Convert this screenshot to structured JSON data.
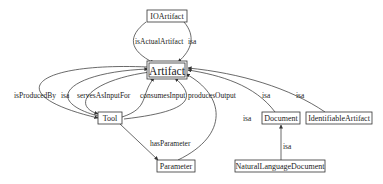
{
  "diagram": {
    "nodes": {
      "ioartifact": {
        "label": "IOArtifact"
      },
      "artifact": {
        "label": "Artifact"
      },
      "tool": {
        "label": "Tool"
      },
      "parameter": {
        "label": "Parameter"
      },
      "document": {
        "label": "Document"
      },
      "identifiable": {
        "label": "IdentifiableArtifact"
      },
      "nldocument": {
        "label": "NaturalLanguageDocument"
      }
    },
    "edges": {
      "io_isActualArtifact": {
        "label": "isActualArtifact",
        "from": "IOArtifact",
        "to": "Artifact"
      },
      "io_isa": {
        "label": "isa",
        "from": "IOArtifact",
        "to": "Artifact"
      },
      "tool_isProducedBy": {
        "label": "isProducedBy",
        "from": "Artifact",
        "to": "Tool"
      },
      "tool_isa": {
        "label": "isa",
        "from": "Tool",
        "to": "Artifact"
      },
      "tool_servesAsInputFor": {
        "label": "servesAsInputFor",
        "from": "Artifact",
        "to": "Tool"
      },
      "tool_consumesInput": {
        "label": "consumesInput",
        "from": "Tool",
        "to": "Artifact"
      },
      "tool_producesOutput": {
        "label": "producesOutput",
        "from": "Tool",
        "to": "Artifact"
      },
      "tool_hasParameter": {
        "label": "hasParameter",
        "from": "Tool",
        "to": "Parameter"
      },
      "param_isa": {
        "label": "isa",
        "from": "Parameter",
        "to": "Artifact"
      },
      "doc_isa": {
        "label": "isa",
        "from": "Document",
        "to": "Artifact"
      },
      "ident_isa": {
        "label": "isa",
        "from": "IdentifiableArtifact",
        "to": "Artifact"
      },
      "nl_isa": {
        "label": "isa",
        "from": "NaturalLanguageDocument",
        "to": "Document"
      }
    }
  }
}
